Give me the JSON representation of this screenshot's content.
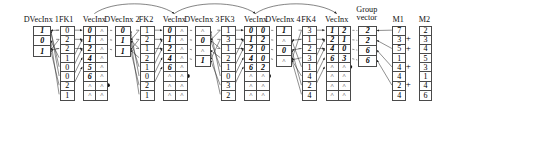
{
  "diagram": {
    "caret_symbol": "^",
    "plus_symbol": "+",
    "columns": [
      {
        "id": "dvecinx1",
        "label": "DVecInx 1",
        "kind": "single",
        "x": 48,
        "y": 36,
        "cell_w": 24,
        "cell_h": 15,
        "values": [
          "1",
          "0",
          "1"
        ],
        "bold": true
      },
      {
        "id": "fk1",
        "label": "FK1",
        "kind": "single",
        "x": 88,
        "y": 36,
        "cell_w": 20,
        "cell_h": 14,
        "values": [
          "0",
          "2",
          "2",
          "1",
          "0",
          "0",
          "2",
          "1"
        ],
        "bold": false
      },
      {
        "id": "vecinx1",
        "label": "VecInx",
        "kind": "double",
        "x": 124,
        "y": 36,
        "cell_w": 17,
        "cell_h": 14,
        "left": [
          "0",
          "1",
          "2",
          "4",
          "5",
          "6",
          "^",
          "^"
        ],
        "right": [
          "^",
          "^",
          "^",
          "^",
          "^",
          "^",
          "^",
          "^"
        ],
        "dot_row": 7
      },
      {
        "id": "dvecinx2",
        "label": "DVecInx 2",
        "kind": "single",
        "x": 172,
        "y": 36,
        "cell_w": 22,
        "cell_h": 15,
        "values": [
          "0",
          "1",
          "1"
        ],
        "bold": true
      },
      {
        "id": "fk2",
        "label": "FK2",
        "kind": "single",
        "x": 210,
        "y": 36,
        "cell_w": 20,
        "cell_h": 14,
        "values": [
          "1",
          "2",
          "1",
          "2",
          "1",
          "0",
          "2",
          "1"
        ],
        "bold": false
      },
      {
        "id": "vecinx2",
        "label": "VecInx",
        "kind": "double",
        "x": 246,
        "y": 36,
        "cell_w": 17,
        "cell_h": 14,
        "left": [
          "0",
          "1",
          "2",
          "4",
          "6",
          "^",
          "^",
          "^"
        ],
        "right": [
          "^",
          "^",
          "^",
          "^",
          "^",
          "^",
          "^",
          "^"
        ],
        "dot_row": 6
      },
      {
        "id": "dvecinx3",
        "label": "DVecInx 3",
        "kind": "single",
        "x": 294,
        "y": 36,
        "cell_w": 22,
        "cell_h": 15,
        "values": [
          "^",
          "0",
          "^",
          "1"
        ],
        "bold": true
      },
      {
        "id": "fk3",
        "label": "FK3",
        "kind": "single",
        "x": 334,
        "y": 36,
        "cell_w": 20,
        "cell_h": 14,
        "values": [
          "1",
          "3",
          "1",
          "2",
          "1",
          "0",
          "3",
          "2"
        ],
        "bold": false
      },
      {
        "id": "vecinx3",
        "label": "VecInx",
        "kind": "double",
        "x": 370,
        "y": 36,
        "cell_w": 17,
        "cell_h": 14,
        "left": [
          "0",
          "1",
          "2",
          "4",
          "6",
          "^",
          "^",
          "^"
        ],
        "right": [
          "0",
          "2",
          "0",
          "0",
          "2",
          "^",
          "^",
          "^"
        ],
        "dot_row": 6
      },
      {
        "id": "dvecinx4",
        "label": "DVecInx 4",
        "kind": "single",
        "x": 418,
        "y": 36,
        "cell_w": 22,
        "cell_h": 15,
        "values": [
          "1",
          "^",
          "0",
          "^"
        ],
        "bold": true
      },
      {
        "id": "fk4",
        "label": "FK4",
        "kind": "single",
        "x": 458,
        "y": 36,
        "cell_w": 20,
        "cell_h": 14,
        "values": [
          "3",
          "1",
          "2",
          "3",
          "1",
          "4",
          "2",
          "4"
        ],
        "bold": false
      },
      {
        "id": "vecinx4",
        "label": "VecInx",
        "kind": "double",
        "x": 494,
        "y": 36,
        "cell_w": 17,
        "cell_h": 14,
        "left": [
          "1",
          "2",
          "4",
          "6",
          "^",
          "^",
          "^",
          "^"
        ],
        "right": [
          "2",
          "1",
          "0",
          "3",
          "^",
          "^",
          "^",
          "^"
        ],
        "dot_row": 5
      },
      {
        "id": "groupvector",
        "label": "Group",
        "label2": "vector",
        "kind": "single",
        "x": 544,
        "y": 36,
        "cell_w": 26,
        "cell_h": 15,
        "values": [
          "2",
          "2",
          "6",
          "6"
        ],
        "bold": true
      },
      {
        "id": "m1",
        "label": "M1",
        "kind": "single",
        "x": 596,
        "y": 36,
        "cell_w": 18,
        "cell_h": 14,
        "values": [
          "7",
          "3",
          "5",
          "1",
          "4",
          "4",
          "2",
          "4"
        ],
        "bold": false
      },
      {
        "id": "m2",
        "label": "M2",
        "kind": "single",
        "x": 636,
        "y": 36,
        "cell_w": 18,
        "cell_h": 14,
        "values": [
          "2",
          "3",
          "4",
          "5",
          "3",
          "1",
          "4",
          "6"
        ],
        "bold": false
      }
    ],
    "plus_rows": [
      2,
      3,
      5,
      7
    ]
  }
}
